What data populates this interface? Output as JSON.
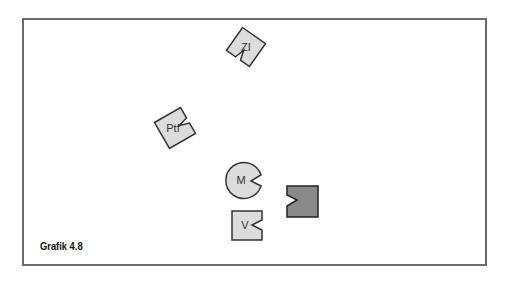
{
  "figure": {
    "caption": "Grafik 4.8",
    "colors": {
      "frame": "#6b6b6b",
      "light_fill": "#dcdcdc",
      "dark_fill": "#8a8a8a",
      "stroke": "#333333"
    },
    "shapes": [
      {
        "id": "zi",
        "type": "notched-square",
        "label": "ZI",
        "fill": "light",
        "rotation": 30
      },
      {
        "id": "ptf",
        "type": "notched-square",
        "label": "Ptf",
        "fill": "light",
        "rotation": -30
      },
      {
        "id": "m",
        "type": "notched-circle",
        "label": "M",
        "fill": "light"
      },
      {
        "id": "v",
        "type": "notched-square",
        "label": "V",
        "fill": "light"
      },
      {
        "id": "dark",
        "type": "notched-square",
        "label": "",
        "fill": "dark"
      }
    ]
  }
}
